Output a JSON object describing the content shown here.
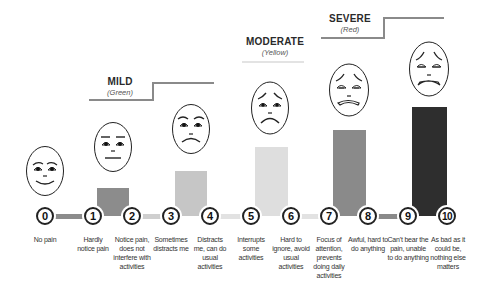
{
  "categories": [
    {
      "title": "MILD",
      "subtitle": "(Green)"
    },
    {
      "title": "MODERATE",
      "subtitle": "(Yellow)"
    },
    {
      "title": "SEVERE",
      "subtitle": "(Red)"
    }
  ],
  "scale": [
    {
      "value": "0",
      "description": "No pain"
    },
    {
      "value": "1",
      "description": "Hardly notice pain"
    },
    {
      "value": "2",
      "description": "Notice pain, does not interfere with activities"
    },
    {
      "value": "3",
      "description": "Sometimes distracts me"
    },
    {
      "value": "4",
      "description": "Distracts me, can do usual activities"
    },
    {
      "value": "5",
      "description": "Interrupts some activities"
    },
    {
      "value": "6",
      "description": "Hard to ignore, avoid usual activities"
    },
    {
      "value": "7",
      "description": "Focus of attention, prevents doing daily activities"
    },
    {
      "value": "8",
      "description": "Awful, hard to do anything"
    },
    {
      "value": "9",
      "description": "Can't bear the pain, unable to do anything"
    },
    {
      "value": "10",
      "description": "As bad as it could be, nothing else matters"
    }
  ],
  "faces": [
    {
      "level": "0",
      "expression": "smiling"
    },
    {
      "level": "2",
      "expression": "neutral"
    },
    {
      "level": "4",
      "expression": "frowning"
    },
    {
      "level": "6",
      "expression": "sad"
    },
    {
      "level": "8",
      "expression": "very-sad"
    },
    {
      "level": "10",
      "expression": "crying-grimace"
    }
  ],
  "colors": {
    "bar1": "#8c8c8c",
    "bar2": "#c4c4c4",
    "bar3": "#dedede",
    "bar4": "#8a8a8a",
    "bar5": "#2c2c2c",
    "step": "#8a8a8a"
  }
}
